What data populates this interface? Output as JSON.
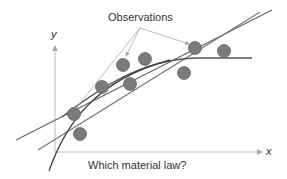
{
  "title": "Observations",
  "question": "Which material law?",
  "axes": {
    "x_label": "x",
    "y_label": "y"
  },
  "colors": {
    "point": "#777777",
    "curve": "#555555",
    "axis": "#bbbbbb",
    "arrow": "#aaaaaa"
  },
  "observations": [
    {
      "x": 74,
      "y": 114
    },
    {
      "x": 80,
      "y": 134
    },
    {
      "x": 102,
      "y": 87
    },
    {
      "x": 130,
      "y": 84
    },
    {
      "x": 123,
      "y": 65
    },
    {
      "x": 145,
      "y": 59
    },
    {
      "x": 184,
      "y": 73
    },
    {
      "x": 195,
      "y": 48
    },
    {
      "x": 224,
      "y": 51
    }
  ],
  "fits": [
    {
      "name": "linear-fit-1"
    },
    {
      "name": "linear-fit-2"
    },
    {
      "name": "saturating-fit"
    },
    {
      "name": "steep-fit"
    }
  ]
}
